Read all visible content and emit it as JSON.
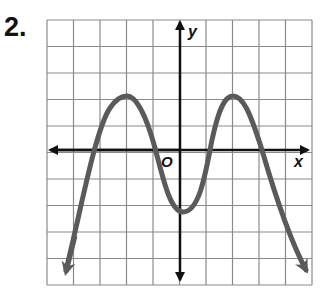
{
  "problem_number": "2.",
  "chart_data": {
    "type": "line",
    "title": "",
    "xlabel": "x",
    "ylabel": "y",
    "origin_label": "O",
    "xlim": [
      -5,
      5
    ],
    "ylim": [
      -5,
      5
    ],
    "grid": true,
    "grid_step": 1,
    "tick_labels": false,
    "series": [
      {
        "name": "polynomial curve",
        "color": "#5a5a5a",
        "description": "Even-degree polynomial, negative leading coefficient; both ends point down",
        "x": [
          -4.5,
          -3.4,
          -2,
          -0.9,
          0,
          0.9,
          2,
          3.4,
          5
        ],
        "y": [
          -4.8,
          0,
          2,
          0,
          -2.4,
          0,
          2,
          0,
          -4.8
        ],
        "end_arrows": true
      }
    ],
    "key_points": {
      "relative_maxima": [
        [
          -2,
          2
        ],
        [
          2,
          2
        ]
      ],
      "relative_minimum": [
        0,
        -2.4
      ],
      "x_intercepts_approx": [
        -3.4,
        -0.9,
        0.9,
        3.4
      ]
    }
  }
}
